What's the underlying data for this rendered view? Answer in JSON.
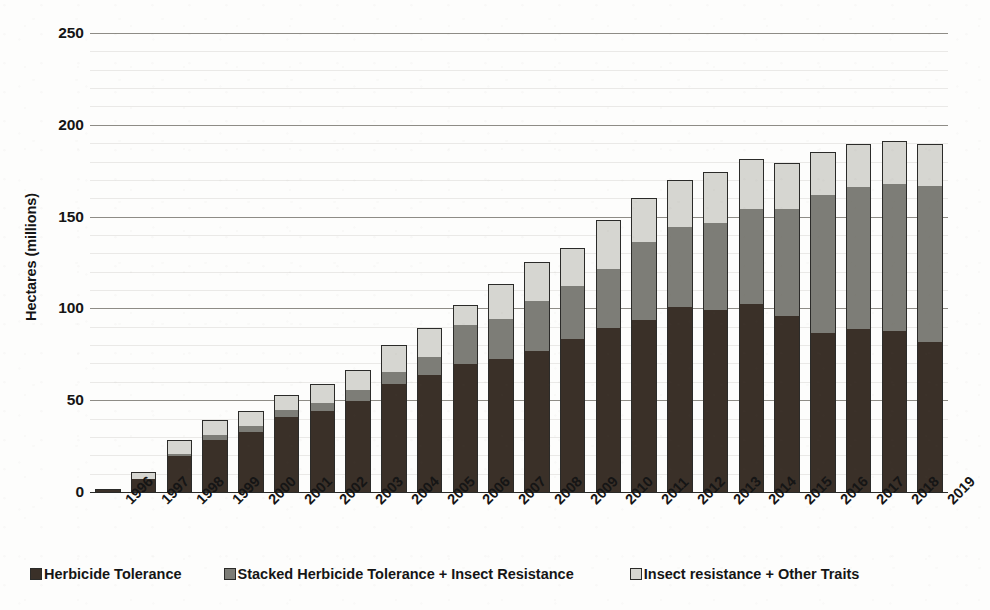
{
  "chart_data": {
    "type": "bar",
    "stacked": true,
    "title": "",
    "xlabel": "",
    "ylabel": "Hectares (millions)",
    "ylim": [
      0,
      250
    ],
    "ytick_step": 50,
    "yticks": [
      250,
      200,
      150,
      100,
      50,
      0
    ],
    "grid": true,
    "legend_position": "bottom",
    "categories": [
      "1996",
      "1997",
      "1998",
      "1999",
      "2000",
      "2001",
      "2002",
      "2003",
      "2004",
      "2005",
      "2006",
      "2007",
      "2008",
      "2009",
      "2010",
      "2011",
      "2012",
      "2013",
      "2014",
      "2015",
      "2016",
      "2017",
      "2018",
      "2019"
    ],
    "series": [
      {
        "name": "Herbicide Tolerance",
        "color": "#3a3028",
        "values": [
          1.7,
          6.9,
          19.8,
          28.1,
          32.7,
          40.6,
          44.2,
          49.7,
          58.6,
          63.7,
          69.9,
          72.2,
          77.0,
          83.6,
          89.3,
          93.9,
          100.5,
          99.4,
          102.6,
          95.9,
          86.5,
          88.7,
          87.5,
          81.5
        ]
      },
      {
        "name": "Stacked Herbicide Tolerance + Insect Resistance",
        "color": "#7d7d77",
        "values": [
          0.0,
          0.0,
          0.3,
          2.9,
          3.2,
          4.2,
          4.4,
          5.8,
          6.8,
          10.1,
          21.0,
          21.8,
          26.9,
          28.7,
          32.3,
          42.2,
          43.7,
          47.1,
          51.4,
          58.5,
          75.4,
          77.7,
          80.5,
          85.1
        ]
      },
      {
        "name": "Insect resistance + Other Traits",
        "color": "#d6d6d1",
        "values": [
          0.0,
          4.1,
          7.7,
          8.1,
          8.3,
          7.8,
          10.1,
          11.0,
          14.6,
          15.4,
          11.2,
          19.2,
          21.4,
          20.6,
          26.4,
          23.9,
          26.0,
          28.0,
          27.4,
          24.6,
          23.3,
          23.4,
          23.3,
          23.1
        ]
      }
    ],
    "totals": [
      1.7,
      11.0,
      27.8,
      39.1,
      44.2,
      52.6,
      58.7,
      66.5,
      80.0,
      89.2,
      102.1,
      113.2,
      125.3,
      132.9,
      148.0,
      160.0,
      170.2,
      174.5,
      181.4,
      179.0,
      185.2,
      189.8,
      191.3,
      189.7
    ]
  },
  "axis": {
    "y_title": "Hectares (millions)",
    "y_tick_labels": [
      "250",
      "200",
      "150",
      "100",
      "50",
      "0"
    ]
  },
  "legend": {
    "items": [
      {
        "label": "Herbicide Tolerance",
        "color": "#3a3028"
      },
      {
        "label": "Stacked Herbicide Tolerance + Insect Resistance",
        "color": "#7d7d77"
      },
      {
        "label": "Insect resistance + Other Traits",
        "color": "#d6d6d1"
      }
    ]
  }
}
